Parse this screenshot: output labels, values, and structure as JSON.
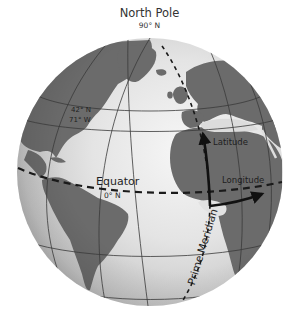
{
  "title": {
    "main": "North Pole",
    "sub": "90° N"
  },
  "labels": {
    "location_lat": "42° N",
    "location_lon": "71° W",
    "equator": "Equator",
    "equator_sub": "0° N",
    "latitude_arrow": "Latitude",
    "longitude_arrow": "Longitude",
    "prime_meridian": "Prime Meridian"
  },
  "colors": {
    "ocean_light": "#e6e6e6",
    "ocean_shade": "#a9a9a9",
    "land": "#6b6b6b",
    "grid": "#3a3a3a",
    "arrow": "#111111",
    "text": "#2a2a2a"
  },
  "globe": {
    "center_x": 150,
    "center_y": 172,
    "radius": 133
  }
}
